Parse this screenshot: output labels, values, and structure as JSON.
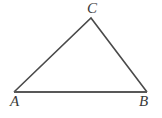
{
  "figure": {
    "background_color": "#ffffff",
    "stroke_color": "#4a4a4a",
    "base_stroke_color": "#585858",
    "label_color": "#3a3a3a",
    "vertices": [
      {
        "name": "A",
        "label": "A",
        "x": 14,
        "y": 92,
        "label_x": 10,
        "label_y": 94
      },
      {
        "name": "B",
        "label": "B",
        "x": 147,
        "y": 92,
        "label_x": 139,
        "label_y": 94
      },
      {
        "name": "C",
        "label": "C",
        "x": 91,
        "y": 18,
        "label_x": 87,
        "label_y": 1
      }
    ],
    "edges": [
      {
        "name": "edge-AC",
        "from": "A",
        "to": "C",
        "width": 1.6
      },
      {
        "name": "edge-CB",
        "from": "C",
        "to": "B",
        "width": 1.6
      },
      {
        "name": "edge-AB",
        "from": "A",
        "to": "B",
        "width": 2.0
      }
    ],
    "polygon_points": "14,92 91,18 147,92"
  }
}
